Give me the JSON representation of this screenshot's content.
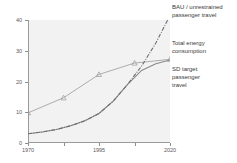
{
  "chart_data": {
    "type": "line",
    "title": "",
    "xlabel": "",
    "ylabel": "",
    "xlim": [
      1970,
      2020
    ],
    "ylim": [
      0,
      40
    ],
    "xticks": [
      1970,
      1995,
      2020
    ],
    "xticklabels": [
      "1970",
      "1995",
      "2020"
    ],
    "xminor_ticks": [
      1982.5,
      2007.5
    ],
    "yticks": [
      0,
      10,
      20,
      30,
      40
    ],
    "yticklabels": [
      "0",
      "10",
      "20",
      "30",
      "40"
    ],
    "grid": false,
    "legend_position": "right-outside",
    "series": [
      {
        "name": "BAU / unrestrained passenger travel",
        "style": "dash-dot",
        "color": "#6e6e6e",
        "marker": "none",
        "x": [
          1970,
          1975,
          1980,
          1985,
          1990,
          1995,
          2000,
          2005,
          2010,
          2015,
          2020
        ],
        "y": [
          3.0,
          3.6,
          4.4,
          5.6,
          7.2,
          9.6,
          13.6,
          19.0,
          25.0,
          32.5,
          41.5
        ]
      },
      {
        "name": "Total energy consumption",
        "style": "solid",
        "color": "#9a9a9a",
        "marker": "triangle",
        "x": [
          1970,
          1982.5,
          1995,
          2007.5,
          2020
        ],
        "y": [
          9.8,
          14.7,
          22.3,
          26.0,
          27.2
        ]
      },
      {
        "name": "SD target passenger travel",
        "style": "solid",
        "color": "#8a8a8a",
        "marker": "none",
        "x": [
          1970,
          1975,
          1980,
          1985,
          1990,
          1995,
          2000,
          2005,
          2010,
          2015,
          2020
        ],
        "y": [
          3.0,
          3.6,
          4.4,
          5.6,
          7.2,
          9.6,
          13.6,
          19.0,
          23.6,
          25.8,
          27.0
        ]
      }
    ],
    "legend_entries": [
      "BAU / unrestrained\npassenger travel",
      "Total energy\nconsumption",
      "SD target\npassenger\ntravel"
    ]
  }
}
